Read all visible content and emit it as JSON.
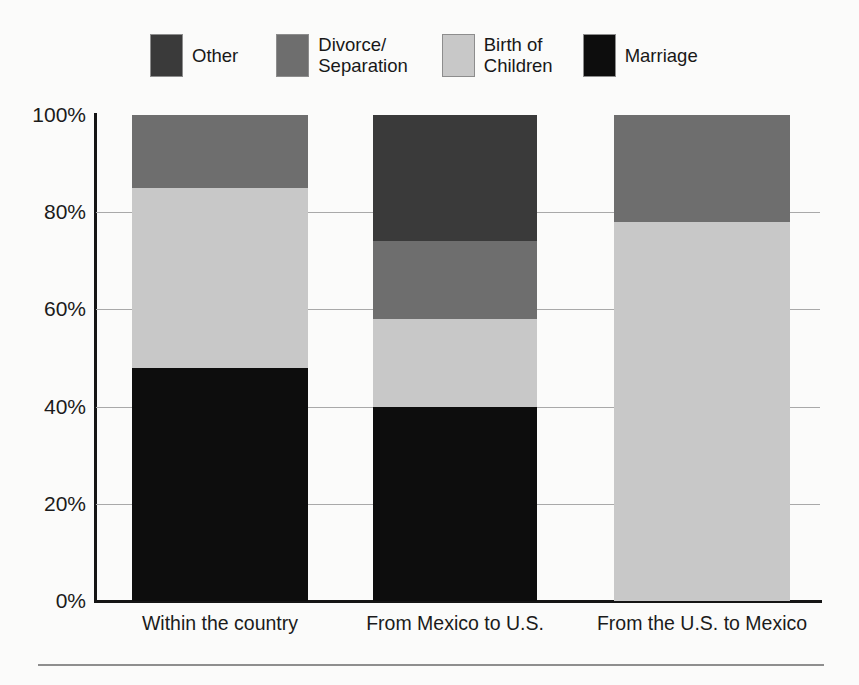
{
  "chart_data": {
    "type": "bar",
    "subtype": "stacked-100-percent",
    "title": "",
    "xlabel": "",
    "ylabel": "",
    "ylim": [
      0,
      100
    ],
    "yticks": [
      "0%",
      "20%",
      "40%",
      "60%",
      "80%",
      "100%"
    ],
    "ytick_values": [
      0,
      20,
      40,
      60,
      80,
      100
    ],
    "grid": true,
    "grid_axis": "y",
    "legend_position": "top",
    "categories": [
      "Within the country",
      "From Mexico to U.S.",
      "From the U.S. to Mexico"
    ],
    "series": [
      {
        "name": "Marriage",
        "color": "#0d0d0d",
        "values": [
          48,
          40,
          0
        ]
      },
      {
        "name": "Birth of Children",
        "color": "#c8c8c8",
        "values": [
          37,
          18,
          78
        ]
      },
      {
        "name": "Divorce/Separation",
        "color": "#6e6e6e",
        "values": [
          15,
          16,
          22
        ]
      },
      {
        "name": "Other",
        "color": "#3a3a3a",
        "values": [
          0,
          26,
          0
        ]
      }
    ],
    "stack_order_bottom_to_top": [
      "Marriage",
      "Birth of Children",
      "Divorce/Separation",
      "Other"
    ],
    "cumulative_tops": {
      "Within the country": {
        "Marriage": 48,
        "Birth of Children": 85,
        "Divorce/Separation": 100,
        "Other": 100
      },
      "From Mexico to U.S.": {
        "Marriage": 40,
        "Birth of Children": 58,
        "Divorce/Separation": 74,
        "Other": 100
      },
      "From the U.S. to Mexico": {
        "Marriage": 0,
        "Birth of Children": 78,
        "Divorce/Separation": 100,
        "Other": 100
      }
    }
  },
  "legend": {
    "items": [
      {
        "label": "Other",
        "color": "#3a3a3a",
        "lines": 1
      },
      {
        "label": "Divorce/\nSeparation",
        "color": "#6e6e6e",
        "lines": 2
      },
      {
        "label": "Birth of\nChildren",
        "color": "#c8c8c8",
        "lines": 2
      },
      {
        "label": "Marriage",
        "color": "#0d0d0d",
        "lines": 1
      }
    ]
  },
  "axes": {
    "y_labels": [
      "100%",
      "80%",
      "60%",
      "40%",
      "20%",
      "0%"
    ],
    "x_labels": [
      "Within the country",
      "From Mexico to U.S.",
      "From the U.S. to Mexico"
    ]
  },
  "colors": {
    "other": "#3a3a3a",
    "divorce_separation": "#6e6e6e",
    "birth_of_children": "#c8c8c8",
    "marriage": "#0d0d0d",
    "axis": "#151515",
    "grid": "#a9a9a9",
    "background": "#fbfbfa"
  }
}
